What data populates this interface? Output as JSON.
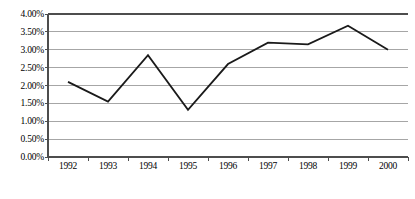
{
  "chart_data": {
    "type": "line",
    "title": "",
    "subtitle": "",
    "xlabel": "",
    "ylabel": "",
    "categories": [
      "1992",
      "1993",
      "1994",
      "1995",
      "1996",
      "1997",
      "1998",
      "1999",
      "2000"
    ],
    "series": [
      {
        "name": "",
        "values": [
          2.1,
          1.55,
          2.85,
          1.32,
          2.6,
          3.2,
          3.15,
          3.67,
          3.0
        ]
      }
    ],
    "ylim": [
      0.0,
      4.0
    ],
    "ytick_values": [
      0.0,
      0.5,
      1.0,
      1.5,
      2.0,
      2.5,
      3.0,
      3.5,
      4.0
    ],
    "ytick_labels": [
      "0.00%",
      "0.50%",
      "1.00%",
      "1.50%",
      "2.00%",
      "2.50%",
      "3.00%",
      "3.50%",
      "4.00%"
    ],
    "value_format": "percent",
    "grid": true,
    "grid_axis": "y",
    "legend": false,
    "legend_position": "none",
    "markers": false,
    "annotations": []
  },
  "style": {
    "background_color": "#ffffff",
    "line_color": "#1a1a1a",
    "gridline_color": "#a6a6a6",
    "axis_color": "#4d4d4d",
    "tick_color": "#4d4d4d",
    "text_color": "#000000",
    "line_width": 1.8
  },
  "geometry": {
    "plot_left": 48,
    "plot_right": 408,
    "plot_top": 14,
    "plot_bottom": 157
  }
}
